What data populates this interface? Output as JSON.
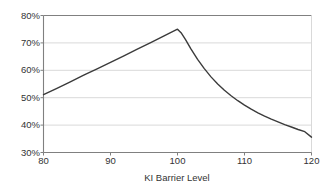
{
  "chart_data": {
    "type": "line",
    "title": "",
    "subtitle": "",
    "xlabel": "KI Barrier Level",
    "ylabel": "",
    "xlim": [
      80,
      120
    ],
    "ylim": [
      0.3,
      0.8
    ],
    "grid": true,
    "legend": false,
    "legend_position": "none",
    "y_tick_labels": [
      "80%",
      "70%",
      "60%",
      "50%",
      "40%",
      "30%"
    ],
    "y_tick_values": [
      0.8,
      0.7,
      0.6,
      0.5,
      0.4,
      0.3
    ],
    "x_tick_labels": [
      "80",
      "90",
      "100",
      "110",
      "120"
    ],
    "x_tick_values": [
      80,
      90,
      100,
      110,
      120
    ],
    "series": [
      {
        "name": "",
        "color": "#3b3b3b",
        "x": [
          80,
          82,
          84,
          86,
          88,
          90,
          92,
          94,
          96,
          98,
          100,
          100.6,
          101.2,
          102,
          103,
          104,
          105,
          106,
          107,
          108,
          109,
          110,
          111,
          112,
          113,
          114,
          115,
          116,
          117,
          118,
          119,
          120
        ],
        "values": [
          0.511,
          0.534,
          0.558,
          0.582,
          0.605,
          0.629,
          0.653,
          0.677,
          0.701,
          0.726,
          0.75,
          0.735,
          0.712,
          0.678,
          0.64,
          0.606,
          0.576,
          0.55,
          0.527,
          0.507,
          0.489,
          0.473,
          0.458,
          0.445,
          0.433,
          0.422,
          0.412,
          0.402,
          0.393,
          0.384,
          0.376,
          0.356
        ]
      }
    ],
    "annotations": [],
    "peak": {
      "x": 100,
      "y": 0.75
    },
    "start": {
      "x": 80,
      "y": 0.511
    },
    "end": {
      "x": 120,
      "y": 0.356
    },
    "colors": {
      "line": "#3b3b3b",
      "grid": "#d9d9d9",
      "axis": "#808080",
      "text": "#333333",
      "background": "#ffffff"
    }
  }
}
